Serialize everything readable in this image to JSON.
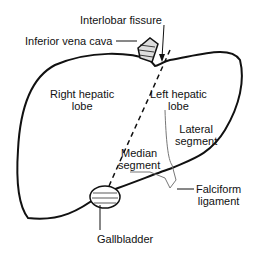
{
  "labels": {
    "interlobar_fissure": "Interlobar fissure",
    "inferior_vena_cava": "Inferior vena cava",
    "right_lobe_1": "Right hepatic",
    "right_lobe_2": "lobe",
    "left_lobe_1": "Left hepatic",
    "left_lobe_2": "lobe",
    "lateral_1": "Lateral",
    "lateral_2": "segment",
    "median_1": "Median",
    "median_2": "segment",
    "falciform_1": "Falciform",
    "falciform_2": "ligament",
    "gallbladder": "Gallbladder"
  },
  "colors": {
    "ink": "#111111",
    "background": "#ffffff"
  }
}
